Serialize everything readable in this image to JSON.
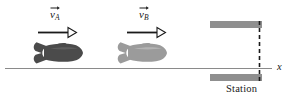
{
  "figure": {
    "title": "",
    "background_color": "#ffffff",
    "width": 294,
    "height": 99
  },
  "axis": {
    "name": "x-axis",
    "label": "x",
    "line_color": "#8a8a8a",
    "y": 68,
    "x_start": 5,
    "x_end": 272,
    "label_x": 277,
    "label_y": 63
  },
  "vectors": [
    {
      "id": "vA",
      "label_v": "v",
      "label_sub": "A",
      "label_x": 50,
      "label_y": 9,
      "arrow": {
        "name": "velocity-arrow-a",
        "x_start": 38,
        "x_end": 76,
        "y": 32,
        "color": "#1a1a1a",
        "head_style": "open-triangle"
      }
    },
    {
      "id": "vB",
      "label_v": "v",
      "label_sub": "B",
      "label_x": 139,
      "label_y": 9,
      "arrow": {
        "name": "velocity-arrow-b",
        "x_start": 127,
        "x_end": 165,
        "y": 32,
        "color": "#1a1a1a",
        "head_style": "open-triangle"
      }
    }
  ],
  "rockets": [
    {
      "id": "rocket-a",
      "name": "rocket-a",
      "color": "#4b4b4b",
      "highlight_color": "#6f6f6f",
      "x_left": 33,
      "x_right": 83,
      "y_center": 53
    },
    {
      "id": "rocket-b",
      "name": "rocket-b",
      "color": "#9b9b9b",
      "highlight_color": "#bcbcbc",
      "x_left": 117,
      "x_right": 167,
      "y_center": 53
    }
  ],
  "station": {
    "label": "Station",
    "label_x": 226,
    "label_y": 83,
    "bar_color": "#8f8f8f",
    "bar_x_start": 210,
    "bar_x_end": 262,
    "top_bar_y": 21,
    "top_bar_height": 7,
    "bottom_bar_y": 74,
    "bottom_bar_height": 7,
    "dashed_line": {
      "name": "station-reference-dashed-line",
      "x": 259,
      "y_start": 21,
      "y_end": 81,
      "color": "#1a1a1a",
      "dash": "4,3"
    }
  }
}
